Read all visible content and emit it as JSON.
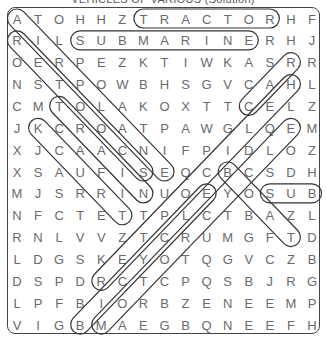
{
  "title": "VEHICLES OF VARIOUS (Solution)",
  "grid": {
    "rows": 15,
    "cols": 15,
    "letters": [
      [
        "A",
        "T",
        "O",
        "H",
        "H",
        "Z",
        "T",
        "R",
        "A",
        "C",
        "T",
        "O",
        "R",
        "H",
        "F"
      ],
      [
        "R",
        "I",
        "L",
        "S",
        "U",
        "B",
        "M",
        "A",
        "R",
        "I",
        "N",
        "E",
        "R",
        "H",
        "J"
      ],
      [
        "O",
        "E",
        "R",
        "P",
        "E",
        "Z",
        "K",
        "T",
        "I",
        "W",
        "K",
        "A",
        "S",
        "R",
        "R"
      ],
      [
        "N",
        "S",
        "T",
        "P",
        "O",
        "W",
        "B",
        "H",
        "S",
        "G",
        "V",
        "C",
        "A",
        "H",
        "L"
      ],
      [
        "C",
        "M",
        "T",
        "O",
        "L",
        "A",
        "K",
        "O",
        "X",
        "T",
        "T",
        "C",
        "E",
        "L",
        "Z"
      ],
      [
        "J",
        "K",
        "C",
        "R",
        "O",
        "A",
        "T",
        "P",
        "A",
        "W",
        "G",
        "L",
        "Q",
        "E",
        "M"
      ],
      [
        "X",
        "J",
        "C",
        "A",
        "A",
        "C",
        "N",
        "I",
        "F",
        "P",
        "I",
        "D",
        "L",
        "O",
        "Z"
      ],
      [
        "X",
        "S",
        "A",
        "U",
        "F",
        "I",
        "S",
        "E",
        "Q",
        "C",
        "B",
        "C",
        "S",
        "D",
        "H"
      ],
      [
        "M",
        "J",
        "S",
        "R",
        "R",
        "I",
        "N",
        "U",
        "O",
        "E",
        "Y",
        "O",
        "S",
        "U",
        "B"
      ],
      [
        "N",
        "F",
        "C",
        "T",
        "E",
        "T",
        "T",
        "P",
        "L",
        "C",
        "T",
        "B",
        "A",
        "Z",
        "L"
      ],
      [
        "R",
        "N",
        "L",
        "V",
        "V",
        "Z",
        "T",
        "C",
        "R",
        "U",
        "M",
        "G",
        "F",
        "T",
        "D"
      ],
      [
        "L",
        "D",
        "G",
        "S",
        "K",
        "E",
        "Y",
        "O",
        "T",
        "Q",
        "G",
        "V",
        "C",
        "Z",
        "B"
      ],
      [
        "D",
        "S",
        "P",
        "D",
        "R",
        "C",
        "T",
        "C",
        "P",
        "Q",
        "S",
        "B",
        "J",
        "R",
        "G"
      ],
      [
        "L",
        "P",
        "F",
        "B",
        "I",
        "O",
        "R",
        "B",
        "Z",
        "E",
        "N",
        "E",
        "E",
        "M",
        "P"
      ],
      [
        "V",
        "I",
        "G",
        "B",
        "M",
        "A",
        "E",
        "G",
        "B",
        "Q",
        "N",
        "E",
        "E",
        "F",
        "H"
      ]
    ]
  },
  "found_words": [
    {
      "word": "TRACTOR",
      "start": [
        1,
        7
      ],
      "end": [
        1,
        13
      ]
    },
    {
      "word": "SUBMARINE",
      "start": [
        2,
        4
      ],
      "end": [
        2,
        12
      ]
    },
    {
      "word": "SUB",
      "start": [
        9,
        13
      ],
      "end": [
        9,
        15
      ]
    },
    {
      "word": "AIRPLANE",
      "start": [
        1,
        1
      ],
      "end": [
        8,
        8
      ]
    },
    {
      "word": "SCOOTER",
      "start": [
        8,
        7
      ],
      "end": [
        2,
        1
      ]
    },
    {
      "word": "TRAIN",
      "start": [
        5,
        3
      ],
      "end": [
        9,
        7
      ]
    },
    {
      "word": "TRUCK",
      "start": [
        10,
        6
      ],
      "end": [
        6,
        2
      ]
    },
    {
      "word": "CAR",
      "start": [
        5,
        12
      ],
      "end": [
        3,
        14
      ]
    },
    {
      "word": "HELICOPTER",
      "start": [
        4,
        14
      ],
      "end": [
        13,
        5
      ]
    },
    {
      "word": "MOTORCYCLE",
      "start": [
        15,
        5
      ],
      "end": [
        6,
        14
      ]
    },
    {
      "word": "BICYCLE",
      "start": [
        15,
        4
      ],
      "end": [
        9,
        10
      ]
    },
    {
      "word": "BOAT",
      "start": [
        8,
        11
      ],
      "end": [
        11,
        14
      ]
    }
  ],
  "colors": {
    "letter": "#6a6a6a",
    "outline": "#333333",
    "border": "#444444"
  }
}
